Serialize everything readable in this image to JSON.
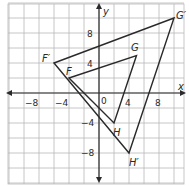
{
  "diagram": {
    "type": "coordinate-plane-dilation",
    "axes": {
      "x_label": "x",
      "y_label": "y",
      "origin_label": "0",
      "x_ticks": [
        "−8",
        "−4",
        "4",
        "8"
      ],
      "y_ticks": [
        "8",
        "4",
        "−4",
        "−8"
      ],
      "grid_step": 2,
      "x_range": [
        -12,
        11
      ],
      "y_range": [
        -11,
        12
      ]
    },
    "preimage": {
      "name": "FGH",
      "vertices": [
        {
          "label": "F",
          "x": -4,
          "y": 2
        },
        {
          "label": "G",
          "x": 5,
          "y": 5
        },
        {
          "label": "H",
          "x": 2,
          "y": -4
        }
      ]
    },
    "image": {
      "name": "F'G'H'",
      "vertices": [
        {
          "label": "F′",
          "x": -6,
          "y": 4
        },
        {
          "label": "G′",
          "x": 10,
          "y": 10
        },
        {
          "label": "H′",
          "x": 4,
          "y": -8
        }
      ]
    },
    "colors": {
      "grid": "#b8b8b8",
      "axis": "#2a2a2a",
      "triangle": "#2a2a2a",
      "background": "#ffffff"
    }
  }
}
